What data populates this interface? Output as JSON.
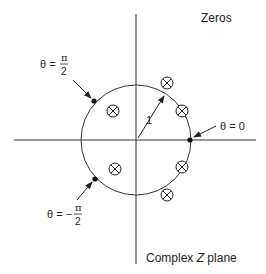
{
  "diagram": {
    "title": "Complex Z plane",
    "legend_label": "Zeros",
    "plane_label_prefix": "Complex ",
    "plane_label_var": "Z",
    "plane_label_suffix": " plane",
    "radius_label": "1",
    "theta_zero_label": "θ = 0",
    "theta_pi2": {
      "lhs": "θ = ",
      "num": "π",
      "den": "2"
    },
    "theta_neg_pi2": {
      "lhs": "θ = −",
      "num": "π",
      "den": "2"
    },
    "colors": {
      "stroke": "#222222",
      "background": "#ffffff"
    },
    "origin": {
      "x": 136,
      "y": 140
    },
    "unit_circle_radius_px": 55,
    "marked_points": [
      {
        "name": "theta-0",
        "x": 190,
        "y": 140
      },
      {
        "name": "theta-pi-over-2",
        "x": 94,
        "y": 101
      },
      {
        "name": "theta-neg-pi-over-2",
        "x": 95,
        "y": 179
      }
    ],
    "zeros": [
      {
        "x": 167,
        "y": 83
      },
      {
        "x": 182,
        "y": 111
      },
      {
        "x": 113,
        "y": 111
      },
      {
        "x": 115,
        "y": 169
      },
      {
        "x": 182,
        "y": 167
      },
      {
        "x": 167,
        "y": 195
      }
    ]
  }
}
